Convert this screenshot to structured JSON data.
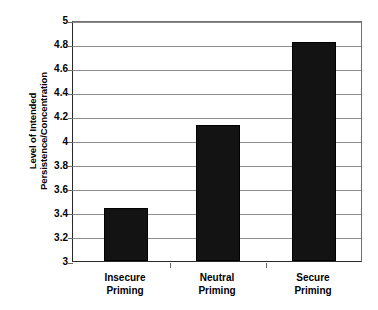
{
  "chart_data": {
    "type": "bar",
    "title": "",
    "subtitle": "",
    "xlabel": "",
    "ylabel": "Level of Intended Persistence/Concentration",
    "ylabel_lines": [
      "Level of Intended",
      "Persistence/Concentration"
    ],
    "categories": [
      "Insecure Priming",
      "Neutral Priming",
      "Secure Priming"
    ],
    "category_lines": [
      [
        "Insecure",
        "Priming"
      ],
      [
        "Neutral",
        "Priming"
      ],
      [
        "Secure",
        "Priming"
      ]
    ],
    "values": [
      3.44,
      4.13,
      4.82
    ],
    "ylim": [
      3,
      5
    ],
    "ytick_step": 0.2,
    "yticks": [
      3,
      3.2,
      3.4,
      3.6,
      3.8,
      4,
      4.2,
      4.4,
      4.6,
      4.8,
      5
    ],
    "ytick_labels": [
      "3",
      "3.2",
      "3.4",
      "3.6",
      "3.8",
      "4",
      "4.2",
      "4.4",
      "4.6",
      "4.8",
      "5"
    ],
    "grid": true,
    "grid_axis": "y",
    "legend": false,
    "legend_position": "none",
    "bar_color": "#131313",
    "grid_color": "#8e8e8e",
    "axis_color": "#2a2a2a",
    "background_color": "#ffffff"
  },
  "figure": {
    "plot_left": 72,
    "plot_top": 21,
    "plot_width": 290,
    "plot_height": 241,
    "bar_width": 44,
    "bar_centers": [
      125,
      217,
      313
    ]
  }
}
